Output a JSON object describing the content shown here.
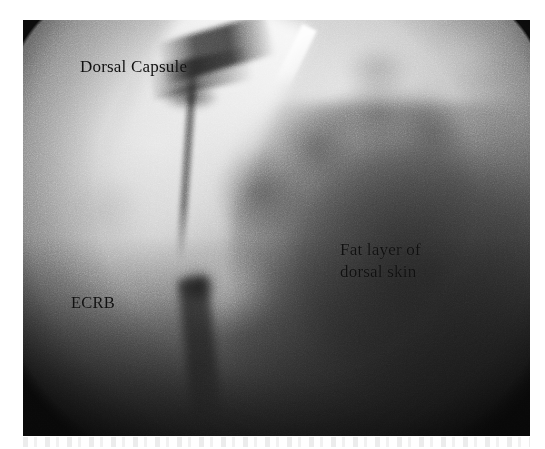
{
  "figure": {
    "kind": "arthroscopic-photograph",
    "modality": "grayscale endoscopic / arthroscopic view",
    "region": "dorsal wrist",
    "background_color": "#ffffff",
    "plate_tone": "#8d8d8d"
  },
  "annotations": [
    {
      "id": "dorsal-capsule",
      "text": "Dorsal Capsule",
      "color": "#101010",
      "position": "upper-left"
    },
    {
      "id": "ecrb",
      "text": "ECRB",
      "color": "#101010",
      "position": "left-middle"
    },
    {
      "id": "fat-layer",
      "text": "Fat layer of\ndorsal skin",
      "color": "#101010",
      "position": "right-middle"
    }
  ]
}
